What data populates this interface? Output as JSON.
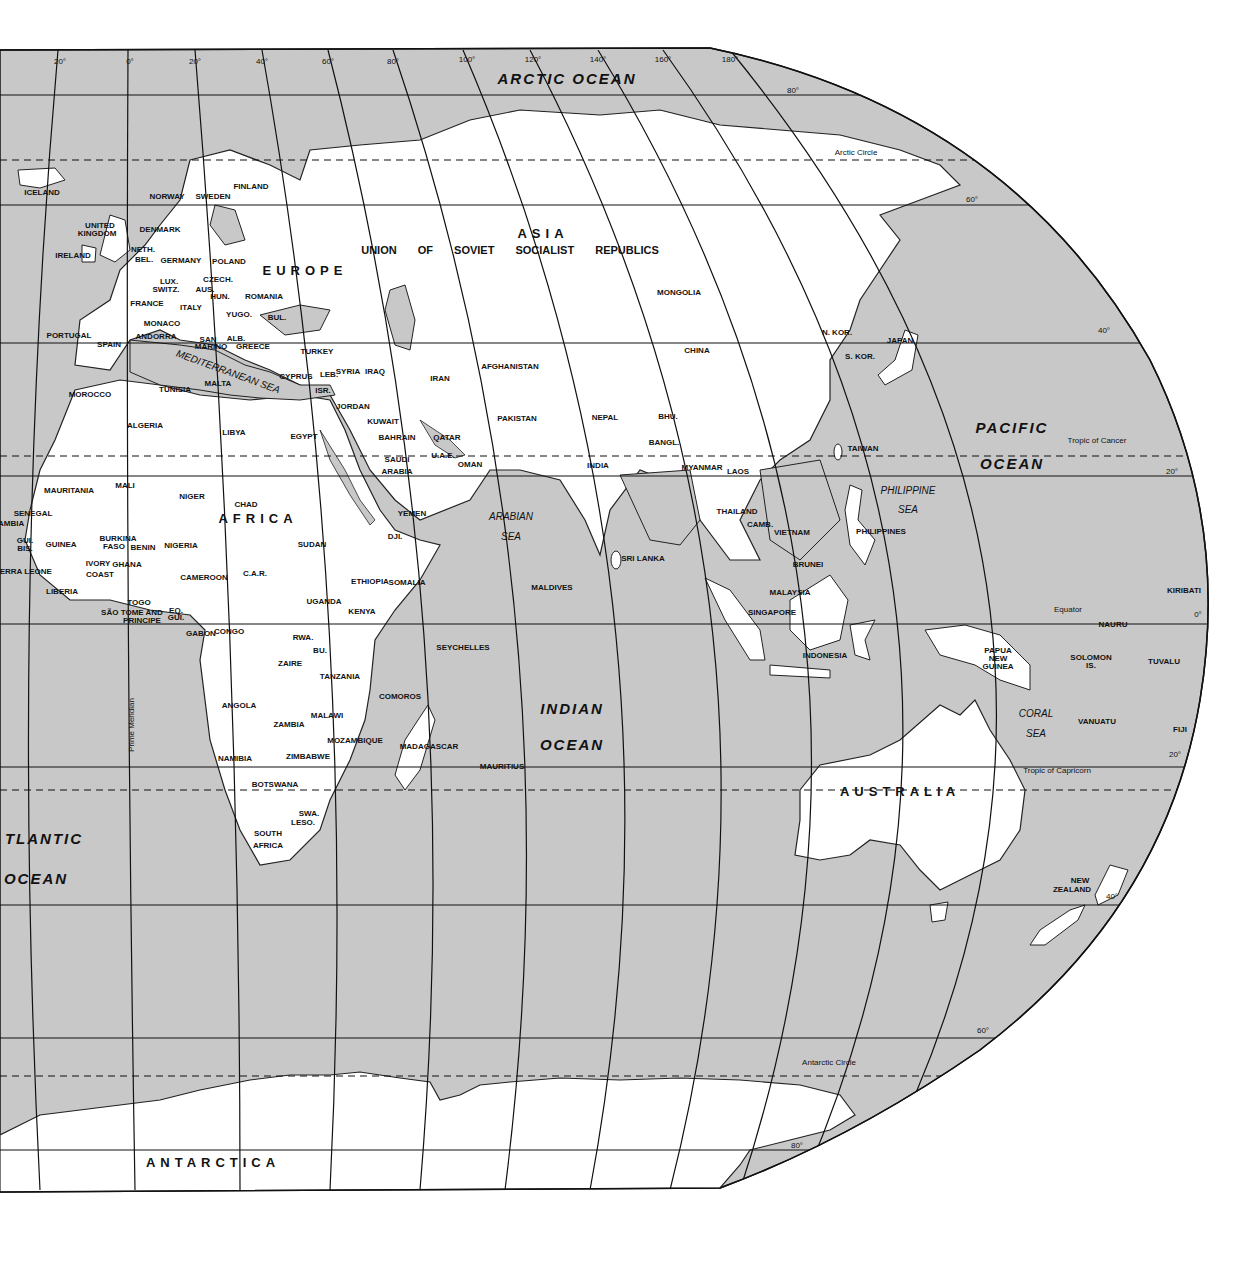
{
  "map": {
    "title": "World Map — Eastern Hemisphere",
    "colors": {
      "ocean": "#c8c8c8",
      "land": "#ffffff",
      "border": "#222222",
      "grid": "#111111"
    },
    "continents": [
      {
        "name": "ASIA",
        "x": 543,
        "y": 233
      },
      {
        "name": "EUROPE",
        "x": 305,
        "y": 270
      },
      {
        "name": "AFRICA",
        "x": 258,
        "y": 518
      },
      {
        "name": "AUSTRALIA",
        "x": 900,
        "y": 791
      },
      {
        "name": "ANTARCTICA",
        "x": 213,
        "y": 1162
      }
    ],
    "ussr_label": "UNION OF SOVIET SOCIALIST REPUBLICS",
    "oceans": [
      {
        "name": "ARCTIC OCEAN",
        "x": 567,
        "y": 78
      },
      {
        "name": "PACIFIC",
        "x": 1012,
        "y": 427
      },
      {
        "name": "OCEAN",
        "x": 1012,
        "y": 463
      },
      {
        "name": "INDIAN",
        "x": 572,
        "y": 708
      },
      {
        "name": "OCEAN",
        "x": 572,
        "y": 744
      },
      {
        "name": "TLANTIC",
        "x": 44,
        "y": 838
      },
      {
        "name": "OCEAN",
        "x": 36,
        "y": 878
      }
    ],
    "seas": [
      {
        "name": "MEDITERRANEAN SEA",
        "x": 228,
        "y": 372,
        "rot": 20
      },
      {
        "name": "ARABIAN",
        "x": 511,
        "y": 517,
        "rot": 0
      },
      {
        "name": "SEA",
        "x": 511,
        "y": 537,
        "rot": 0
      },
      {
        "name": "PHILIPPINE",
        "x": 908,
        "y": 491,
        "rot": 0
      },
      {
        "name": "SEA",
        "x": 908,
        "y": 510,
        "rot": 0
      },
      {
        "name": "CORAL",
        "x": 1036,
        "y": 714,
        "rot": 0
      },
      {
        "name": "SEA",
        "x": 1036,
        "y": 734,
        "rot": 0
      }
    ],
    "countries": [
      {
        "name": "ICELAND",
        "x": 42,
        "y": 193
      },
      {
        "name": "NORWAY",
        "x": 167,
        "y": 197
      },
      {
        "name": "SWEDEN",
        "x": 213,
        "y": 197
      },
      {
        "name": "FINLAND",
        "x": 251,
        "y": 187
      },
      {
        "name": "DENMARK",
        "x": 160,
        "y": 230
      },
      {
        "name": "UNITED",
        "x": 100,
        "y": 226
      },
      {
        "name": "KINGDOM",
        "x": 97,
        "y": 234
      },
      {
        "name": "IRELAND",
        "x": 73,
        "y": 256
      },
      {
        "name": "NETH.",
        "x": 143,
        "y": 250
      },
      {
        "name": "BEL.",
        "x": 144,
        "y": 260
      },
      {
        "name": "GERMANY",
        "x": 181,
        "y": 261
      },
      {
        "name": "POLAND",
        "x": 229,
        "y": 262
      },
      {
        "name": "CZECH.",
        "x": 218,
        "y": 280
      },
      {
        "name": "LUX.",
        "x": 169,
        "y": 282
      },
      {
        "name": "SWITZ.",
        "x": 166,
        "y": 290
      },
      {
        "name": "AUS.",
        "x": 205,
        "y": 290
      },
      {
        "name": "HUN.",
        "x": 220,
        "y": 297
      },
      {
        "name": "ROMANIA",
        "x": 264,
        "y": 297
      },
      {
        "name": "FRANCE",
        "x": 147,
        "y": 304
      },
      {
        "name": "ITALY",
        "x": 191,
        "y": 308
      },
      {
        "name": "YUGO.",
        "x": 239,
        "y": 315
      },
      {
        "name": "BUL.",
        "x": 277,
        "y": 318
      },
      {
        "name": "MONACO",
        "x": 162,
        "y": 324
      },
      {
        "name": "ANDORRA",
        "x": 156,
        "y": 337
      },
      {
        "name": "SAN",
        "x": 208,
        "y": 340
      },
      {
        "name": "MARINO",
        "x": 211,
        "y": 347
      },
      {
        "name": "ALB.",
        "x": 236,
        "y": 339
      },
      {
        "name": "GREECE",
        "x": 253,
        "y": 347
      },
      {
        "name": "PORTUGAL",
        "x": 69,
        "y": 336
      },
      {
        "name": "SPAIN",
        "x": 109,
        "y": 345
      },
      {
        "name": "MALTA",
        "x": 218,
        "y": 384
      },
      {
        "name": "CYPRUS",
        "x": 296,
        "y": 377
      },
      {
        "name": "TURKEY",
        "x": 317,
        "y": 352
      },
      {
        "name": "LEB.",
        "x": 329,
        "y": 375
      },
      {
        "name": "SYRIA",
        "x": 348,
        "y": 372
      },
      {
        "name": "IRAQ",
        "x": 375,
        "y": 372
      },
      {
        "name": "ISR.",
        "x": 323,
        "y": 391
      },
      {
        "name": "JORDAN",
        "x": 353,
        "y": 407
      },
      {
        "name": "KUWAIT",
        "x": 383,
        "y": 422
      },
      {
        "name": "BAHRAIN",
        "x": 397,
        "y": 438
      },
      {
        "name": "QATAR",
        "x": 447,
        "y": 438
      },
      {
        "name": "U.A.E.",
        "x": 443,
        "y": 456
      },
      {
        "name": "OMAN",
        "x": 470,
        "y": 465
      },
      {
        "name": "SAUDI",
        "x": 397,
        "y": 460
      },
      {
        "name": "ARABIA",
        "x": 397,
        "y": 472
      },
      {
        "name": "YEMEN",
        "x": 412,
        "y": 514
      },
      {
        "name": "IRAN",
        "x": 440,
        "y": 379
      },
      {
        "name": "AFGHANISTAN",
        "x": 510,
        "y": 367
      },
      {
        "name": "PAKISTAN",
        "x": 517,
        "y": 419
      },
      {
        "name": "NEPAL",
        "x": 605,
        "y": 418
      },
      {
        "name": "BHU.",
        "x": 668,
        "y": 417
      },
      {
        "name": "BANGL.",
        "x": 664,
        "y": 443
      },
      {
        "name": "INDIA",
        "x": 598,
        "y": 466
      },
      {
        "name": "MYANMAR",
        "x": 702,
        "y": 468
      },
      {
        "name": "LAOS",
        "x": 738,
        "y": 472
      },
      {
        "name": "THAILAND",
        "x": 737,
        "y": 512
      },
      {
        "name": "CAMB.",
        "x": 760,
        "y": 525
      },
      {
        "name": "VIETNAM",
        "x": 792,
        "y": 533
      },
      {
        "name": "MONGOLIA",
        "x": 679,
        "y": 293
      },
      {
        "name": "CHINA",
        "x": 697,
        "y": 351
      },
      {
        "name": "N. KOR.",
        "x": 837,
        "y": 333
      },
      {
        "name": "S. KOR.",
        "x": 860,
        "y": 357
      },
      {
        "name": "JAPAN",
        "x": 900,
        "y": 341
      },
      {
        "name": "TAIWAN",
        "x": 863,
        "y": 449
      },
      {
        "name": "PHILIPPINES",
        "x": 881,
        "y": 532
      },
      {
        "name": "BRUNEI",
        "x": 808,
        "y": 565
      },
      {
        "name": "MALAYSIA",
        "x": 790,
        "y": 593
      },
      {
        "name": "SINGAPORE",
        "x": 772,
        "y": 613
      },
      {
        "name": "INDONESIA",
        "x": 825,
        "y": 656
      },
      {
        "name": "SRI LANKA",
        "x": 643,
        "y": 559
      },
      {
        "name": "MALDIVES",
        "x": 552,
        "y": 588
      },
      {
        "name": "SEYCHELLES",
        "x": 463,
        "y": 648
      },
      {
        "name": "COMOROS",
        "x": 400,
        "y": 697
      },
      {
        "name": "MAURITIUS",
        "x": 502,
        "y": 767
      },
      {
        "name": "MADAGASCAR",
        "x": 429,
        "y": 747
      },
      {
        "name": "MOROCCO",
        "x": 90,
        "y": 395
      },
      {
        "name": "TUNISIA",
        "x": 175,
        "y": 390
      },
      {
        "name": "ALGERIA",
        "x": 145,
        "y": 426
      },
      {
        "name": "LIBYA",
        "x": 234,
        "y": 433
      },
      {
        "name": "EGYPT",
        "x": 304,
        "y": 437
      },
      {
        "name": "MAURITANIA",
        "x": 69,
        "y": 491
      },
      {
        "name": "MALI",
        "x": 125,
        "y": 486
      },
      {
        "name": "NIGER",
        "x": 192,
        "y": 497
      },
      {
        "name": "CHAD",
        "x": 246,
        "y": 505
      },
      {
        "name": "SUDAN",
        "x": 312,
        "y": 545
      },
      {
        "name": "SENEGAL",
        "x": 33,
        "y": 514
      },
      {
        "name": "GAMBIA",
        "x": 8,
        "y": 524
      },
      {
        "name": "GUI.",
        "x": 25,
        "y": 541
      },
      {
        "name": "BIS.",
        "x": 25,
        "y": 549
      },
      {
        "name": "GUINEA",
        "x": 61,
        "y": 545
      },
      {
        "name": "BURKINA",
        "x": 118,
        "y": 539
      },
      {
        "name": "FASO",
        "x": 114,
        "y": 547
      },
      {
        "name": "SIERRA LEONE",
        "x": 22,
        "y": 572
      },
      {
        "name": "IVORY",
        "x": 98,
        "y": 564
      },
      {
        "name": "COAST",
        "x": 100,
        "y": 575
      },
      {
        "name": "GHANA",
        "x": 127,
        "y": 565
      },
      {
        "name": "BENIN",
        "x": 143,
        "y": 548
      },
      {
        "name": "LIBERIA",
        "x": 62,
        "y": 592
      },
      {
        "name": "NIGERIA",
        "x": 181,
        "y": 546
      },
      {
        "name": "CAMEROON",
        "x": 204,
        "y": 578
      },
      {
        "name": "C.A.R.",
        "x": 255,
        "y": 574
      },
      {
        "name": "ETHIOPIA",
        "x": 370,
        "y": 582
      },
      {
        "name": "DJI.",
        "x": 395,
        "y": 537
      },
      {
        "name": "SOMALIA",
        "x": 407,
        "y": 583
      },
      {
        "name": "TOGO",
        "x": 139,
        "y": 603
      },
      {
        "name": "SÃO TOME AND",
        "x": 132,
        "y": 613
      },
      {
        "name": "PRINCIPE",
        "x": 142,
        "y": 621
      },
      {
        "name": "EQ.",
        "x": 176,
        "y": 611
      },
      {
        "name": "GUI.",
        "x": 176,
        "y": 618
      },
      {
        "name": "UGANDA",
        "x": 324,
        "y": 602
      },
      {
        "name": "KENYA",
        "x": 362,
        "y": 612
      },
      {
        "name": "GABON",
        "x": 201,
        "y": 634
      },
      {
        "name": "CONGO",
        "x": 229,
        "y": 632
      },
      {
        "name": "RWA.",
        "x": 303,
        "y": 638
      },
      {
        "name": "BU.",
        "x": 320,
        "y": 651
      },
      {
        "name": "ZAIRE",
        "x": 290,
        "y": 664
      },
      {
        "name": "TANZANIA",
        "x": 340,
        "y": 677
      },
      {
        "name": "ANGOLA",
        "x": 239,
        "y": 706
      },
      {
        "name": "MALAWI",
        "x": 327,
        "y": 716
      },
      {
        "name": "ZAMBIA",
        "x": 289,
        "y": 725
      },
      {
        "name": "MOZAMBIQUE",
        "x": 355,
        "y": 741
      },
      {
        "name": "ZIMBABWE",
        "x": 308,
        "y": 757
      },
      {
        "name": "NAMIBIA",
        "x": 235,
        "y": 759
      },
      {
        "name": "BOTSWANA",
        "x": 275,
        "y": 785
      },
      {
        "name": "SWA.",
        "x": 309,
        "y": 814
      },
      {
        "name": "LESO.",
        "x": 303,
        "y": 823
      },
      {
        "name": "SOUTH",
        "x": 268,
        "y": 834
      },
      {
        "name": "AFRICA",
        "x": 268,
        "y": 846
      },
      {
        "name": "PAPUA",
        "x": 998,
        "y": 651
      },
      {
        "name": "NEW",
        "x": 998,
        "y": 659
      },
      {
        "name": "GUINEA",
        "x": 998,
        "y": 667
      },
      {
        "name": "SOLOMON",
        "x": 1091,
        "y": 658
      },
      {
        "name": "IS.",
        "x": 1091,
        "y": 666
      },
      {
        "name": "NAURU",
        "x": 1113,
        "y": 625
      },
      {
        "name": "KIRIBATI",
        "x": 1184,
        "y": 591
      },
      {
        "name": "TUVALU",
        "x": 1164,
        "y": 662
      },
      {
        "name": "VANUATU",
        "x": 1097,
        "y": 722
      },
      {
        "name": "FIJI",
        "x": 1180,
        "y": 730
      },
      {
        "name": "NEW",
        "x": 1080,
        "y": 881
      },
      {
        "name": "ZEALAND",
        "x": 1072,
        "y": 890
      }
    ],
    "lines": [
      {
        "name": "Arctic Circle",
        "x": 856,
        "y": 153
      },
      {
        "name": "Tropic of Cancer",
        "x": 1097,
        "y": 441
      },
      {
        "name": "Equator",
        "x": 1068,
        "y": 610
      },
      {
        "name": "Tropic of Capricorn",
        "x": 1057,
        "y": 771
      },
      {
        "name": "Antarctic Circle",
        "x": 829,
        "y": 1063
      },
      {
        "name": "Prime Meridian",
        "x": 132,
        "y": 725,
        "rot": -90
      }
    ],
    "degree_labels": [
      {
        "t": "20°",
        "x": 60,
        "y": 62
      },
      {
        "t": "0°",
        "x": 130,
        "y": 62
      },
      {
        "t": "20°",
        "x": 195,
        "y": 62
      },
      {
        "t": "40°",
        "x": 262,
        "y": 62
      },
      {
        "t": "60°",
        "x": 328,
        "y": 62
      },
      {
        "t": "80°",
        "x": 393,
        "y": 62
      },
      {
        "t": "100°",
        "x": 467,
        "y": 60
      },
      {
        "t": "120°",
        "x": 533,
        "y": 60
      },
      {
        "t": "140°",
        "x": 598,
        "y": 60
      },
      {
        "t": "160°",
        "x": 663,
        "y": 60
      },
      {
        "t": "180°",
        "x": 730,
        "y": 60
      },
      {
        "t": "80°",
        "x": 793,
        "y": 91
      },
      {
        "t": "60°",
        "x": 972,
        "y": 200
      },
      {
        "t": "40°",
        "x": 1104,
        "y": 331
      },
      {
        "t": "20°",
        "x": 1172,
        "y": 472
      },
      {
        "t": "0°",
        "x": 1198,
        "y": 615
      },
      {
        "t": "20°",
        "x": 1175,
        "y": 755
      },
      {
        "t": "40°",
        "x": 1112,
        "y": 897
      },
      {
        "t": "60°",
        "x": 983,
        "y": 1031
      },
      {
        "t": "80°",
        "x": 797,
        "y": 1146
      }
    ]
  }
}
